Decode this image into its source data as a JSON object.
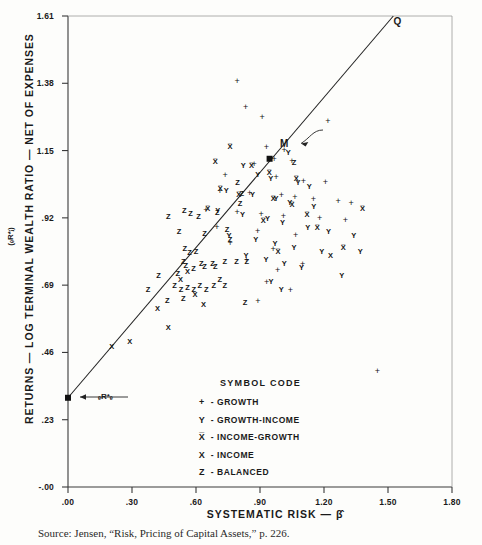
{
  "figure": {
    "y_axis_title": "RETURNS — LOG TERMINAL WEALTH RATIO — NET OF EXPENSES",
    "y_axis_subtitle": "(ₑR*ⱼ)",
    "x_axis_title": "SYSTEMATIC RISK — β̂",
    "source_note": "Source: Jensen, “Risk, Pricing of Capital Assets,” p. 226."
  },
  "legend": {
    "title": "SYMBOL CODE",
    "dash": "-",
    "items": [
      {
        "symbol": "+",
        "label": "GROWTH"
      },
      {
        "symbol": "Y",
        "label": "GROWTH-INCOME"
      },
      {
        "symbol": "X̅",
        "label": "INCOME-GROWTH"
      },
      {
        "symbol": "X",
        "label": "INCOME"
      },
      {
        "symbol": "Z",
        "label": "BALANCED"
      }
    ]
  },
  "annotations": [
    {
      "name": "point-q-label",
      "text": "Q",
      "x": 1.545,
      "y": 1.592
    },
    {
      "name": "point-m-label",
      "text": "M",
      "x": 1.015,
      "y": 1.175
    },
    {
      "name": "risk-free-label",
      "text": "ₑR*ₑ",
      "x": 0.175,
      "y": 0.312
    }
  ],
  "chart_data": {
    "type": "scatter",
    "title": "",
    "xlabel": "SYSTEMATIC RISK — β̂",
    "ylabel": "RETURNS — LOG TERMINAL WEALTH RATIO — NET OF EXPENSES",
    "xlim": [
      0.0,
      1.8
    ],
    "ylim": [
      -0.0,
      1.61
    ],
    "xticks": [
      ".00",
      ".30",
      ".60",
      ".90",
      "1.20",
      "1.50",
      "1.80"
    ],
    "xtick_values": [
      0.0,
      0.3,
      0.6,
      0.9,
      1.2,
      1.5,
      1.8
    ],
    "yticks": [
      "-.00",
      ".23",
      ".46",
      ".69",
      ".92",
      "1.15",
      "1.38",
      "1.61"
    ],
    "ytick_values": [
      0.0,
      0.23,
      0.46,
      0.69,
      0.92,
      1.15,
      1.38,
      1.61
    ],
    "grid": false,
    "legend_position": "inside-lower-center",
    "line": {
      "name": "market-line",
      "from": {
        "x": 0.0,
        "y": 0.305
      },
      "to": {
        "x": 1.525,
        "y": 1.61
      }
    },
    "markers": [
      {
        "name": "risk-free-marker",
        "symbol": "square",
        "x": 0.0,
        "y": 0.305
      },
      {
        "name": "market-portfolio-marker",
        "symbol": "square",
        "x": 0.945,
        "y": 1.122
      }
    ],
    "series": [
      {
        "name": "GROWTH",
        "symbol": "+",
        "points": [
          [
            0.793,
            1.387
          ],
          [
            0.833,
            1.3
          ],
          [
            0.91,
            1.265
          ],
          [
            1.218,
            1.252
          ],
          [
            0.93,
            1.163
          ],
          [
            1.013,
            1.152
          ],
          [
            0.966,
            1.121
          ],
          [
            1.049,
            1.113
          ],
          [
            0.873,
            1.103
          ],
          [
            0.737,
            1.068
          ],
          [
            0.976,
            1.061
          ],
          [
            1.103,
            1.047
          ],
          [
            1.206,
            1.041
          ],
          [
            0.712,
            1.012
          ],
          [
            0.852,
            1.006
          ],
          [
            1.0,
            0.999
          ],
          [
            1.064,
            0.992
          ],
          [
            1.15,
            0.985
          ],
          [
            1.266,
            0.978
          ],
          [
            1.327,
            0.972
          ],
          [
            0.646,
            0.948
          ],
          [
            0.793,
            0.941
          ],
          [
            0.905,
            0.934
          ],
          [
            1.01,
            0.927
          ],
          [
            1.18,
            0.92
          ],
          [
            1.3,
            0.913
          ],
          [
            0.698,
            0.889
          ],
          [
            0.889,
            0.875
          ],
          [
            1.067,
            0.861
          ],
          [
            0.962,
            0.812
          ],
          [
            0.836,
            0.777
          ],
          [
            0.983,
            0.742
          ],
          [
            0.931,
            0.7
          ],
          [
            1.043,
            0.672
          ],
          [
            0.89,
            0.637
          ],
          [
            1.45,
            0.398
          ],
          [
            1.1,
            0.763
          ],
          [
            0.76,
            0.833
          ]
        ]
      },
      {
        "name": "GROWTH-INCOME",
        "symbol": "Y",
        "points": [
          [
            1.033,
            1.142
          ],
          [
            0.822,
            1.096
          ],
          [
            0.89,
            1.068
          ],
          [
            0.95,
            1.054
          ],
          [
            1.078,
            1.04
          ],
          [
            1.131,
            1.026
          ],
          [
            0.742,
            1.012
          ],
          [
            0.865,
            0.999
          ],
          [
            0.975,
            0.985
          ],
          [
            1.04,
            0.971
          ],
          [
            1.152,
            0.957
          ],
          [
            0.702,
            0.943
          ],
          [
            0.818,
            0.929
          ],
          [
            0.935,
            0.915
          ],
          [
            1.005,
            0.901
          ],
          [
            1.124,
            0.887
          ],
          [
            1.221,
            0.873
          ],
          [
            0.755,
            0.859
          ],
          [
            0.88,
            0.845
          ],
          [
            0.97,
            0.831
          ],
          [
            1.06,
            0.817
          ],
          [
            1.19,
            0.803
          ],
          [
            0.835,
            0.789
          ],
          [
            0.928,
            0.775
          ],
          [
            1.014,
            0.761
          ],
          [
            1.095,
            0.747
          ],
          [
            1.34,
            0.859
          ],
          [
            1.37,
            0.803
          ],
          [
            1.283,
            0.721
          ],
          [
            0.952,
            0.7
          ],
          [
            1.0,
            0.672
          ]
        ]
      },
      {
        "name": "INCOME-GROWTH",
        "symbol": "X̅",
        "points": [
          [
            0.76,
            1.163
          ],
          [
            0.69,
            1.11
          ],
          [
            0.86,
            1.096
          ],
          [
            0.944,
            1.075
          ],
          [
            1.07,
            1.054
          ],
          [
            0.714,
            1.019
          ],
          [
            0.8,
            0.999
          ],
          [
            0.962,
            0.985
          ],
          [
            1.05,
            0.964
          ],
          [
            0.655,
            0.95
          ],
          [
            1.12,
            0.929
          ],
          [
            0.915,
            0.908
          ],
          [
            1.168,
            0.887
          ],
          [
            1.38,
            0.95
          ],
          [
            1.29,
            0.817
          ],
          [
            0.985,
            0.803
          ]
        ]
      },
      {
        "name": "INCOME",
        "symbol": "X",
        "points": [
          [
            0.205,
            0.48
          ],
          [
            0.29,
            0.497
          ],
          [
            0.42,
            0.61
          ],
          [
            0.528,
            0.706
          ],
          [
            0.595,
            0.657
          ],
          [
            0.635,
            0.622
          ],
          [
            0.47,
            0.545
          ],
          [
            1.23,
            0.789
          ],
          [
            0.56,
            0.735
          ]
        ]
      },
      {
        "name": "BALANCED",
        "symbol": "Z",
        "points": [
          [
            0.47,
            0.922
          ],
          [
            0.545,
            0.943
          ],
          [
            0.575,
            0.934
          ],
          [
            0.612,
            0.922
          ],
          [
            0.7,
            0.936
          ],
          [
            0.806,
            0.966
          ],
          [
            0.815,
            1.0
          ],
          [
            0.795,
            1.04
          ],
          [
            0.52,
            0.873
          ],
          [
            0.64,
            0.866
          ],
          [
            0.745,
            0.88
          ],
          [
            0.76,
            0.845
          ],
          [
            0.548,
            0.812
          ],
          [
            0.57,
            0.8
          ],
          [
            0.6,
            0.805
          ],
          [
            0.54,
            0.77
          ],
          [
            0.552,
            0.756
          ],
          [
            0.588,
            0.745
          ],
          [
            0.625,
            0.763
          ],
          [
            0.64,
            0.752
          ],
          [
            0.678,
            0.763
          ],
          [
            0.69,
            0.752
          ],
          [
            0.735,
            0.77
          ],
          [
            0.79,
            0.77
          ],
          [
            0.838,
            0.77
          ],
          [
            0.425,
            0.722
          ],
          [
            0.515,
            0.728
          ],
          [
            0.712,
            0.707
          ],
          [
            0.5,
            0.686
          ],
          [
            0.53,
            0.672
          ],
          [
            0.56,
            0.679
          ],
          [
            0.59,
            0.672
          ],
          [
            0.618,
            0.686
          ],
          [
            0.648,
            0.672
          ],
          [
            0.683,
            0.686
          ],
          [
            0.735,
            0.686
          ],
          [
            0.375,
            0.672
          ],
          [
            0.54,
            0.644
          ],
          [
            0.465,
            0.637
          ],
          [
            0.83,
            0.63
          ],
          [
            1.06,
            1.108
          ]
        ]
      }
    ]
  }
}
